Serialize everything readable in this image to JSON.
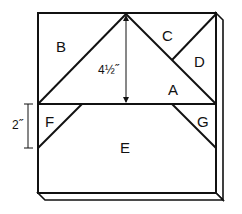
{
  "diagram": {
    "type": "quilt-block-template",
    "pieces": [
      {
        "id": "A",
        "label": "A"
      },
      {
        "id": "B",
        "label": "B"
      },
      {
        "id": "C",
        "label": "C"
      },
      {
        "id": "D",
        "label": "D"
      },
      {
        "id": "E",
        "label": "E"
      },
      {
        "id": "F",
        "label": "F"
      },
      {
        "id": "G",
        "label": "G"
      }
    ],
    "dimensions": {
      "triangle_height": "4½˝",
      "side_height": "2˝"
    },
    "colors": {
      "line": "#111111",
      "fill": "#ffffff"
    }
  }
}
